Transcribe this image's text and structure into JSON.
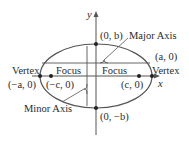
{
  "diagram": {
    "axes": {
      "x_label": "x",
      "y_label": "y"
    },
    "points": {
      "top_covertex": "(0, b)",
      "bottom_covertex": "(0, −b)",
      "right_vertex": "(a, 0)",
      "left_vertex": "(−a, 0)",
      "right_focus": "(c, 0)",
      "left_focus": "(−c, 0)"
    },
    "labels": {
      "major_axis": "Major Axis",
      "minor_axis": "Minor Axis",
      "vertex_left": "Vertex",
      "vertex_right": "Vertex",
      "focus_left": "Focus",
      "focus_right": "Focus"
    },
    "colors": {
      "stroke": "#4a4a4a",
      "text": "#2b2b2b",
      "background": "#ffffff"
    }
  }
}
